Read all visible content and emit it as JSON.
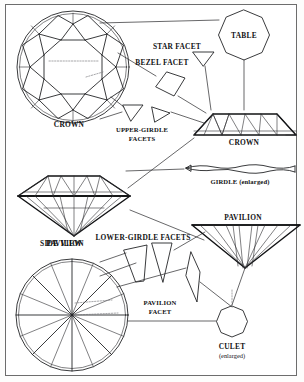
{
  "figure": {
    "background_color": "#ffffff",
    "border_color": "#6d6d6d",
    "line_color": "#17181a"
  },
  "labels": {
    "crown_top_view": "CROWN",
    "star_facet": "STAR FACET",
    "bezel_facet": "BEZEL FACET",
    "table": "TABLE",
    "upper_girdle_facets_line1": "UPPER-GIRDLE",
    "upper_girdle_facets_line2": "FACETS",
    "crown_side_view": "CROWN",
    "girdle": "GIRDLE (enlarged)",
    "pavilion_side_view": "PAVILION",
    "side_view": "SIDE VIEW",
    "lower_girdle_facets": "LOWER-GIRDLE FACETS",
    "pavilion_bottom_view": "PAVILION",
    "pavilion_facet_line1": "PAVILION",
    "pavilion_facet_line2": "FACET",
    "culet": "CULET",
    "culet_note": "(enlarged)"
  },
  "parts": [
    {
      "name": "crown-top-view",
      "shape": "round-brilliant-crown-plan",
      "label": "CROWN"
    },
    {
      "name": "table-facet",
      "shape": "octagon",
      "label": "TABLE"
    },
    {
      "name": "star-facet",
      "shape": "triangle",
      "label": "STAR FACET"
    },
    {
      "name": "bezel-facet",
      "shape": "kite",
      "label": "BEZEL FACET"
    },
    {
      "name": "upper-girdle-facet",
      "shape": "triangle-pair",
      "label": "UPPER-GIRDLE FACETS"
    },
    {
      "name": "crown-side-view",
      "shape": "trapezoid-faceted",
      "label": "CROWN"
    },
    {
      "name": "girdle-enlarged",
      "shape": "wavy-band",
      "label": "GIRDLE (enlarged)"
    },
    {
      "name": "diamond-side-view",
      "shape": "full-brilliant-profile",
      "label": "SIDE VIEW"
    },
    {
      "name": "lower-girdle-facet",
      "shape": "tapered-wedge-pair",
      "label": "LOWER-GIRDLE FACETS"
    },
    {
      "name": "pavilion-side-view",
      "shape": "inverted-triangle-faceted",
      "label": "PAVILION"
    },
    {
      "name": "pavilion-bottom-view",
      "shape": "round-brilliant-pavilion-plan",
      "label": "PAVILION"
    },
    {
      "name": "pavilion-facet",
      "shape": "narrow-kite",
      "label": "PAVILION FACET"
    },
    {
      "name": "culet-enlarged",
      "shape": "octagon",
      "label": "CULET (enlarged)"
    }
  ]
}
